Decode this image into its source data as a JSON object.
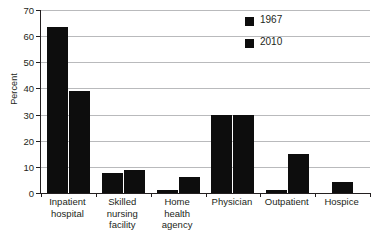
{
  "chart_data": {
    "type": "bar",
    "title": "",
    "xlabel": "",
    "ylabel": "Percent",
    "ylim": [
      0,
      70
    ],
    "yticks": [
      0,
      10,
      20,
      30,
      40,
      50,
      60,
      70
    ],
    "ytick_labels": [
      "0",
      "10",
      "20",
      "30",
      "40",
      "50",
      "60",
      "70"
    ],
    "grid": true,
    "legend_position": "top-right",
    "categories": [
      "Inpatient hospital",
      "Skilled nursing facility",
      "Home health agency",
      "Physician",
      "Outpatient",
      "Hospice"
    ],
    "category_lines": [
      [
        "Inpatient",
        "hospital"
      ],
      [
        "Skilled",
        "nursing",
        "facility"
      ],
      [
        "Home",
        "health",
        "agency"
      ],
      [
        "Physician"
      ],
      [
        "Outpatient"
      ],
      [
        "Hospice"
      ]
    ],
    "series": [
      {
        "name": "1967",
        "color": "#0d0d0d",
        "values": [
          63.5,
          7.5,
          1.0,
          29.8,
          1.0,
          0
        ]
      },
      {
        "name": "2010",
        "color": "#0d0d0d",
        "values": [
          39.2,
          8.7,
          6.1,
          29.8,
          15.1,
          4.3
        ]
      }
    ]
  },
  "legend": {
    "entries": [
      {
        "label": "1967",
        "swatch": "legend-swatch-1967"
      },
      {
        "label": "2010",
        "swatch": "legend-swatch-2010"
      }
    ]
  },
  "axes": {
    "y_title": "Percent"
  },
  "caption": {
    "text": ""
  }
}
